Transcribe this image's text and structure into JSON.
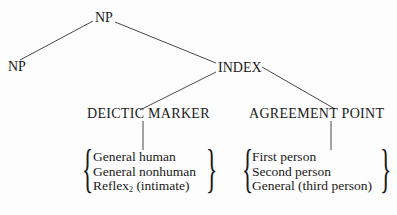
{
  "tree": {
    "root": {
      "label": "NP"
    },
    "left_child": {
      "label": "NP"
    },
    "right_child": {
      "label": "INDEX"
    },
    "index_children": [
      {
        "label": "DEICTIC MARKER",
        "options": [
          "General human",
          "General nonhuman",
          "Reflex",
          "(intimate)"
        ],
        "option_subscript": "2"
      },
      {
        "label": "AGREEMENT POINT",
        "options": [
          "First person",
          "Second person",
          "General (third person)"
        ]
      }
    ]
  }
}
